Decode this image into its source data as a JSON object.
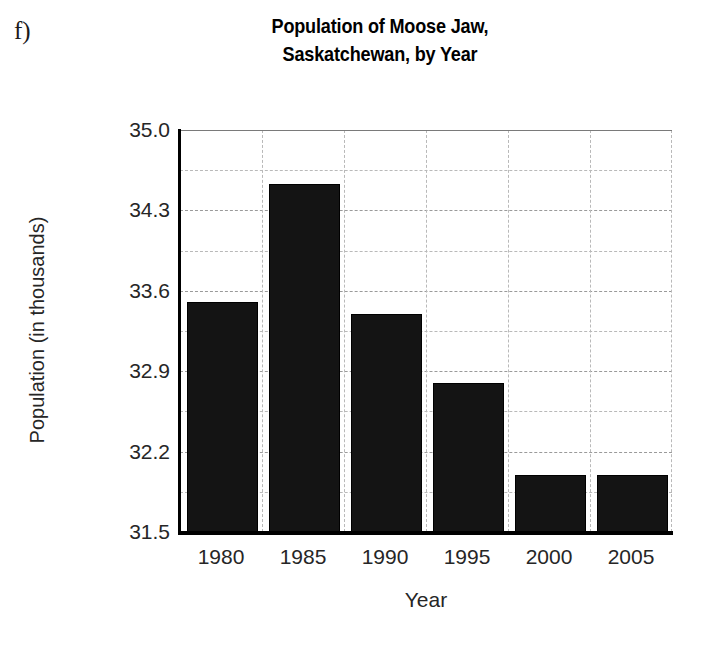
{
  "part_label": "f)",
  "axes": {
    "x_title": "Year",
    "y_title": "Population (in thousands)",
    "y_ticks": [
      "35.0",
      "34.3",
      "33.6",
      "32.9",
      "32.2",
      "31.5"
    ],
    "x_ticks": [
      "1980",
      "1985",
      "1990",
      "1995",
      "2000",
      "2005"
    ]
  },
  "chart_data": {
    "type": "bar",
    "title": "Population of Moose Jaw, Saskatchewan, by Year",
    "title_lines": [
      "Population of Moose Jaw,",
      "Saskatchewan, by Year"
    ],
    "xlabel": "Year",
    "ylabel": "Population (in thousands)",
    "categories": [
      "1980",
      "1985",
      "1990",
      "1995",
      "2000",
      "2005"
    ],
    "values": [
      33.5,
      34.53,
      33.4,
      32.8,
      32.0,
      32.0
    ],
    "ylim": [
      31.5,
      35.0
    ],
    "y_tick_step": 0.7,
    "y_minor_step": 0.35,
    "grid": true,
    "grid_style": "dashed",
    "legend": "none",
    "bar_color": "#141414"
  }
}
